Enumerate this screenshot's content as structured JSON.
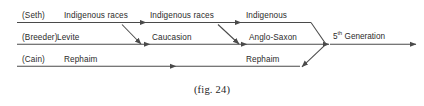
{
  "figure": {
    "caption": "(fig. 24)",
    "line_color": "#4a4a4a",
    "text_color": "#2b2b2b"
  },
  "rows": [
    {
      "source": "(Seth)",
      "stages": [
        "Indigenous races",
        "Indigenous races",
        "Indigenous"
      ]
    },
    {
      "source": "(Breeder)",
      "stages": [
        "Levite",
        "Caucasion",
        "Anglo-Saxon"
      ]
    },
    {
      "source": "(Cain)",
      "stages": [
        "Rephaim",
        "Rephaim"
      ]
    }
  ],
  "outcome": {
    "ordinal": "5",
    "ordinal_suffix": "th",
    "label": " Generation"
  }
}
